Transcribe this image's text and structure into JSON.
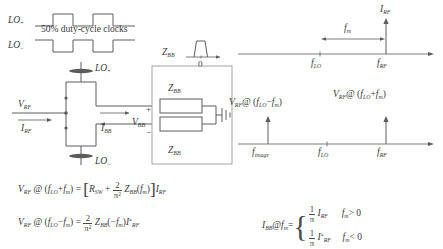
{
  "figure": {
    "type": "rf-passive-mixer-diagram",
    "ink_color": "#5c5c5c",
    "box_color": "#9a9a9a",
    "background": "#ffffff"
  },
  "clocks": {
    "lo_plus_label": "LO",
    "lo_plus_sub": "+",
    "lo_minus_label": "LO",
    "lo_minus_sub": "−",
    "caption": "50% duty-cycle clocks"
  },
  "zbb_pulse": {
    "label": "Z",
    "label_sub": "BB",
    "origin_tick": "0"
  },
  "circuit": {
    "vrf_label": "V",
    "vrf_sub": "RF",
    "irf_label": "I",
    "irf_sub": "RF",
    "lo_top_label": "LO",
    "lo_top_sub": "+",
    "lo_bottom_label": "LO",
    "lo_bottom_sub": "−",
    "ibb_label": "I",
    "ibb_sub": "BB",
    "vbb_label": "V",
    "vbb_sub": "BB",
    "vbb_plus": "+",
    "vbb_minus": "−",
    "zbb_top_label": "Z",
    "zbb_top_sub": "BB",
    "zbb_bottom_label": "Z",
    "zbb_bottom_sub": "BB"
  },
  "spectrum_top": {
    "current_label": "I",
    "current_sub": "RF",
    "span_label": "f",
    "span_sub": "m",
    "ticks": [
      {
        "label": "f",
        "sub": "LO"
      },
      {
        "label": "f",
        "sub": "RF"
      }
    ]
  },
  "spectrum_bottom": {
    "left_annotation": {
      "v": "V",
      "v_sub": "RF",
      "at": "@ (",
      "f1": "f",
      "f1_sub": "LO",
      "op": "−",
      "f2": "f",
      "f2_sub": "m",
      "close": ")"
    },
    "right_annotation": {
      "v": "V",
      "v_sub": "RF",
      "at": "@ (",
      "f1": "f",
      "f1_sub": "LO",
      "op": "+",
      "f2": "f",
      "f2_sub": "m",
      "close": ")"
    },
    "ticks": [
      {
        "label": "f",
        "sub": "image"
      },
      {
        "label": "f",
        "sub": "LO"
      },
      {
        "label": "f",
        "sub": "RF"
      }
    ]
  },
  "equations": {
    "eq1": {
      "lhs_v": "V",
      "lhs_v_sub": "RF",
      "at": "@ (",
      "f_lo": "f",
      "f_lo_sub": "LO",
      "op": "+",
      "f_m": "f",
      "f_m_sub": "m",
      "close": ")",
      "equals": "=",
      "bracket_open": "[",
      "rsw": "R",
      "rsw_sub": "SW",
      "plus": "+",
      "frac_num": "2",
      "frac_den": "π",
      "frac_den_sup": "2",
      "zbb": "Z",
      "zbb_sub": "BB",
      "zbb_arg_open": "(",
      "zbb_arg_f": "f",
      "zbb_arg_sub": "m",
      "zbb_arg_close": ")",
      "bracket_close": "]",
      "irf": "I",
      "irf_sub": "RF"
    },
    "eq2": {
      "lhs_v": "V",
      "lhs_v_sub": "RF",
      "at": "@ (",
      "f_lo": "f",
      "f_lo_sub": "LO",
      "op": "−",
      "f_m": "f",
      "f_m_sub": "m",
      "close": ")",
      "equals": "=",
      "frac_num": "2",
      "frac_den": "π",
      "frac_den_sup": "2",
      "zbb": "Z",
      "zbb_sub": "BB",
      "zbb_arg_open": "(",
      "zbb_arg_sign": "−",
      "zbb_arg_f": "f",
      "zbb_arg_sub": "m",
      "zbb_arg_close": ")",
      "irf": "I",
      "irf_star": "*",
      "irf_sub": "RF"
    },
    "eq3": {
      "lhs_i": "I",
      "lhs_i_sub": "BB",
      "at": "@",
      "f_m": "f",
      "f_m_sub": "m",
      "equals": "=",
      "case1": {
        "frac_num": "1",
        "frac_den": "π",
        "i": "I",
        "i_sub": "RF",
        "cond_f": "f",
        "cond_sub": "m",
        "cond_op": "> 0"
      },
      "case2": {
        "frac_num": "1",
        "frac_den": "π",
        "i": "I",
        "i_star": "*",
        "i_sub": "RF",
        "cond_f": "f",
        "cond_sub": "m",
        "cond_op": "< 0"
      }
    }
  }
}
